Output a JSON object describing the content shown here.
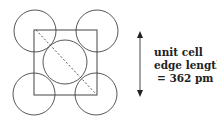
{
  "diagram": {
    "type": "unit cell face (face-centered cubic)",
    "label": {
      "line1": "unit cell",
      "line2": "edge length",
      "line3": "= 362 pm"
    },
    "colors": {
      "stroke": "#444444",
      "background": "#ffffff"
    }
  }
}
